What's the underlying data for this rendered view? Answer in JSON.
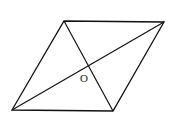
{
  "diagram": {
    "type": "rhombus-with-diagonals",
    "vertices": {
      "top_left": [
        64,
        21
      ],
      "top_right": [
        164,
        22
      ],
      "bottom_right": [
        113,
        111
      ],
      "bottom_left": [
        12,
        110
      ]
    },
    "center_label": "O",
    "center_label_pos": [
      83,
      78
    ],
    "stroke_color": "#111111"
  }
}
